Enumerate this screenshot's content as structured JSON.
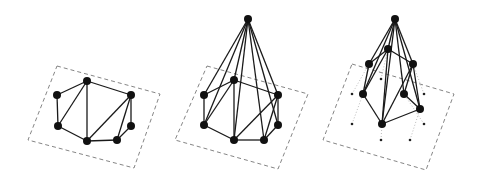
{
  "figure": {
    "panels": [
      {
        "name": "planar-triangulation",
        "frame": [
          [
            57,
            66
          ],
          [
            160,
            94
          ],
          [
            134,
            168
          ],
          [
            28,
            140
          ]
        ],
        "nodes": [
          [
            87,
            81
          ],
          [
            57,
            95
          ],
          [
            58,
            126
          ],
          [
            87,
            141
          ],
          [
            117,
            140
          ],
          [
            131,
            126
          ],
          [
            131,
            95
          ]
        ],
        "edges": [
          [
            0,
            1
          ],
          [
            1,
            2
          ],
          [
            2,
            3
          ],
          [
            3,
            4
          ],
          [
            4,
            5
          ],
          [
            5,
            6
          ],
          [
            6,
            0
          ],
          [
            0,
            2
          ],
          [
            0,
            3
          ],
          [
            3,
            6
          ],
          [
            4,
            6
          ]
        ],
        "apex": null,
        "footprints": []
      },
      {
        "name": "cone-over-triangulation",
        "frame": [
          [
            207,
            66
          ],
          [
            308,
            94
          ],
          [
            278,
            169
          ],
          [
            175,
            140
          ]
        ],
        "nodes": [
          [
            234,
            80
          ],
          [
            204,
            95
          ],
          [
            204,
            125
          ],
          [
            234,
            140
          ],
          [
            264,
            140
          ],
          [
            278,
            125
          ],
          [
            278,
            95
          ]
        ],
        "edges": [
          [
            0,
            1
          ],
          [
            1,
            2
          ],
          [
            2,
            3
          ],
          [
            3,
            4
          ],
          [
            4,
            5
          ],
          [
            5,
            6
          ],
          [
            6,
            0
          ],
          [
            0,
            2
          ],
          [
            0,
            3
          ],
          [
            3,
            6
          ],
          [
            4,
            6
          ]
        ],
        "apex": [
          248,
          19
        ],
        "footprints": []
      },
      {
        "name": "lifted-cone",
        "frame": [
          [
            352,
            64
          ],
          [
            454,
            94
          ],
          [
            426,
            170
          ],
          [
            323,
            140
          ]
        ],
        "nodes": [
          [
            388,
            49
          ],
          [
            369,
            64
          ],
          [
            363,
            94
          ],
          [
            382,
            124
          ],
          [
            420,
            109
          ],
          [
            404,
            94
          ],
          [
            413,
            64
          ]
        ],
        "edges": [
          [
            0,
            1
          ],
          [
            1,
            2
          ],
          [
            2,
            3
          ],
          [
            3,
            4
          ],
          [
            4,
            5
          ],
          [
            5,
            6
          ],
          [
            6,
            0
          ],
          [
            0,
            2
          ],
          [
            0,
            3
          ],
          [
            3,
            6
          ],
          [
            4,
            6
          ]
        ],
        "apex": [
          395,
          19
        ],
        "footprints": [
          [
            381,
            79
          ],
          [
            352,
            94
          ],
          [
            352,
            124
          ],
          [
            381,
            140
          ],
          [
            410,
            140
          ],
          [
            424,
            124
          ],
          [
            424,
            94
          ]
        ]
      }
    ]
  }
}
